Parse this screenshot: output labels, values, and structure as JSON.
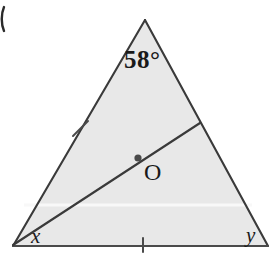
{
  "figure": {
    "kind": "geometry-diagram",
    "shape": "triangle",
    "background_color": "#ffffff",
    "fill_color": "#e8e8e8",
    "stroke_color": "#3a3a3a",
    "label_color": "#1a1a1a",
    "scanline_color": "#f7f7f7",
    "labels": {
      "apex_angle": "58°",
      "interior_point": "O",
      "bottom_left_angle": "x",
      "bottom_right_angle": "y"
    },
    "vertices": {
      "apex": [
        145,
        20
      ],
      "bottom_left": [
        13,
        246
      ],
      "bottom_right": [
        268,
        246
      ]
    },
    "cevian": {
      "from": [
        13,
        246
      ],
      "to": [
        200,
        123
      ]
    },
    "marked_point": [
      138,
      158
    ],
    "tick_marks": [
      {
        "name": "left-side-tick",
        "at": [
          80,
          128
        ]
      },
      {
        "name": "base-tick",
        "at": [
          143,
          246
        ]
      }
    ],
    "scanline": {
      "y": 205,
      "from_x": 24,
      "to_x": 252
    },
    "corner_mark": {
      "at": [
        4,
        18
      ]
    }
  }
}
